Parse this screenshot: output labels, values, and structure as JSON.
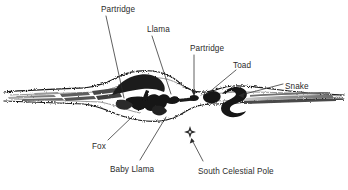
{
  "diagram": {
    "type": "astronomical-illustration",
    "background_color": "#ffffff",
    "ink_color": "#1a1a1a",
    "label_color": "#2b2b2b",
    "labels": [
      {
        "id": "partridge-left",
        "text": "Partridge",
        "x": 101,
        "y": 6,
        "anchor": "start"
      },
      {
        "id": "llama",
        "text": "Llama",
        "x": 147,
        "y": 26,
        "anchor": "start"
      },
      {
        "id": "partridge-center",
        "text": "Partridge",
        "x": 190,
        "y": 45,
        "anchor": "start"
      },
      {
        "id": "toad",
        "text": "Toad",
        "x": 233,
        "y": 62,
        "anchor": "start"
      },
      {
        "id": "snake",
        "text": "Snake",
        "x": 285,
        "y": 83,
        "anchor": "start"
      },
      {
        "id": "fox",
        "text": "Fox",
        "x": 92,
        "y": 143,
        "anchor": "start"
      },
      {
        "id": "baby-llama",
        "text": "Baby Llama",
        "x": 110,
        "y": 166,
        "anchor": "start"
      },
      {
        "id": "south-celestial-pole",
        "text": "South Celestial Pole",
        "x": 198,
        "y": 168,
        "anchor": "start"
      }
    ],
    "leader_lines": [
      {
        "id": "leader-partridge-left",
        "from": [
          106,
          16
        ],
        "to": [
          124,
          98
        ],
        "arrow": false
      },
      {
        "id": "leader-llama",
        "from": [
          152,
          36
        ],
        "to": [
          171,
          94
        ],
        "arrow": false
      },
      {
        "id": "leader-partridge-center",
        "from": [
          194,
          55
        ],
        "to": [
          194,
          96
        ],
        "arrow": true
      },
      {
        "id": "leader-toad",
        "from": [
          236,
          70
        ],
        "to": [
          206,
          95
        ],
        "arrow": false
      },
      {
        "id": "leader-snake",
        "from": [
          283,
          84
        ],
        "to": [
          239,
          96
        ],
        "arrow": true
      },
      {
        "id": "leader-fox",
        "from": [
          108,
          140
        ],
        "to": [
          133,
          117
        ],
        "arrow": false
      },
      {
        "id": "leader-baby-llama",
        "from": [
          140,
          160
        ],
        "to": [
          166,
          118
        ],
        "arrow": false
      },
      {
        "id": "leader-pole",
        "from": [
          202,
          162
        ],
        "to": [
          192,
          140
        ],
        "arrow": true
      }
    ],
    "markers": [
      {
        "id": "south-celestial-pole-marker",
        "shape": "four-point-star",
        "x": 190,
        "y": 132,
        "size": 9
      }
    ],
    "dark_cloud_figures": [
      "Partridge (left)",
      "Llama",
      "Partridge (center)",
      "Toad",
      "Snake",
      "Fox",
      "Baby Llama"
    ]
  }
}
